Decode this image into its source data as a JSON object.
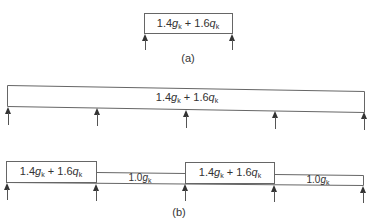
{
  "figure_a": {
    "caption": "(a)",
    "load": {
      "coef1": "1.4",
      "sym1": "g",
      "sub1": "k",
      "op": "+",
      "coef2": "1.6",
      "sym2": "q",
      "sub2": "k"
    },
    "supports": 2
  },
  "figure_continuous": {
    "load": {
      "coef1": "1.4",
      "sym1": "g",
      "sub1": "k",
      "op": "+",
      "coef2": "1.6",
      "sym2": "q",
      "sub2": "k"
    },
    "supports": 5
  },
  "figure_b": {
    "caption": "(b)",
    "spans": [
      {
        "type": "full",
        "coef1": "1.4",
        "sym1": "g",
        "sub1": "k",
        "op": "+",
        "coef2": "1.6",
        "sym2": "q",
        "sub2": "k"
      },
      {
        "type": "dead",
        "coef1": "1.0",
        "sym1": "g",
        "sub1": "k"
      },
      {
        "type": "full",
        "coef1": "1.4",
        "sym1": "g",
        "sub1": "k",
        "op": "+",
        "coef2": "1.6",
        "sym2": "q",
        "sub2": "k"
      },
      {
        "type": "dead",
        "coef1": "1.0",
        "sym1": "g",
        "sub1": "k"
      }
    ],
    "supports": 5
  }
}
